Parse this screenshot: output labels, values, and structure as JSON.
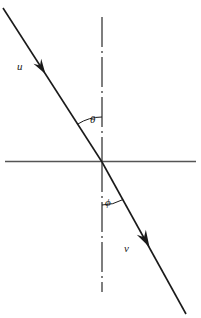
{
  "figure": {
    "background_color": "#ffffff",
    "line_color": "#1a1a1a",
    "axis_color": "#555555",
    "width": 201,
    "height": 318
  },
  "labels": {
    "incident_ray": "u",
    "refracted_ray": "v",
    "angle_of_incidence": "θ",
    "angle_of_refraction": "ϕ"
  },
  "geometry": {
    "intersection": {
      "x": 102,
      "y": 162
    },
    "interface_line": {
      "x1": 5,
      "y1": 161.5,
      "x2": 196,
      "y2": 161.5
    },
    "normal_line": {
      "x": 102,
      "y_top": 17,
      "y_bottom": 292,
      "style": "dash-dot"
    },
    "incident_segment": {
      "x1": 3,
      "y1": 8,
      "x2": 102,
      "y2": 162
    },
    "refracted_segment": {
      "x1": 102,
      "y1": 162,
      "x2": 186,
      "y2": 314
    },
    "incident_arrow": {
      "x": 41,
      "y": 67
    },
    "refracted_arrow": {
      "x": 145,
      "y": 239
    },
    "theta_arc_radius": 45,
    "phi_arc_radius": 43
  },
  "chart_data": {
    "type": "diagram",
    "subtype": "ray-refraction",
    "elements": [
      {
        "name": "interface",
        "kind": "line",
        "orientation": "horizontal",
        "note": "boundary between two media"
      },
      {
        "name": "normal",
        "kind": "line",
        "orientation": "vertical",
        "style": "dash-dot",
        "note": "normal to the interface"
      },
      {
        "name": "incident-ray",
        "kind": "arrowed-line",
        "label": "u",
        "direction": "down-right",
        "angle_from_normal_deg": 33
      },
      {
        "name": "refracted-ray",
        "kind": "arrowed-line",
        "label": "v",
        "direction": "down-right",
        "angle_from_normal_deg": 29
      },
      {
        "name": "angle-theta",
        "kind": "arc",
        "label": "θ",
        "between": [
          "incident-ray",
          "normal"
        ],
        "region": "above-interface"
      },
      {
        "name": "angle-phi",
        "kind": "arc",
        "label": "ϕ",
        "between": [
          "normal",
          "refracted-ray"
        ],
        "region": "below-interface"
      }
    ],
    "annotations": [
      "u",
      "θ",
      "ϕ",
      "v"
    ]
  }
}
